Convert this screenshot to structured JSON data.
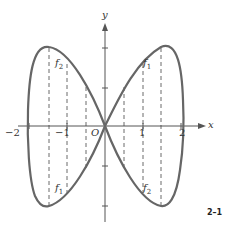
{
  "figure": {
    "label": "2–1",
    "axes": {
      "x_label": "x",
      "y_label": "y",
      "origin_label": "O",
      "x_ticks": [
        "−2",
        "−1",
        "1",
        "2"
      ]
    },
    "curve_labels": {
      "upper_left": "f",
      "upper_left_sub": "2",
      "upper_right": "f",
      "upper_right_sub": "1",
      "lower_left": "f",
      "lower_left_sub": "1",
      "lower_right": "f",
      "lower_right_sub": "2"
    }
  }
}
